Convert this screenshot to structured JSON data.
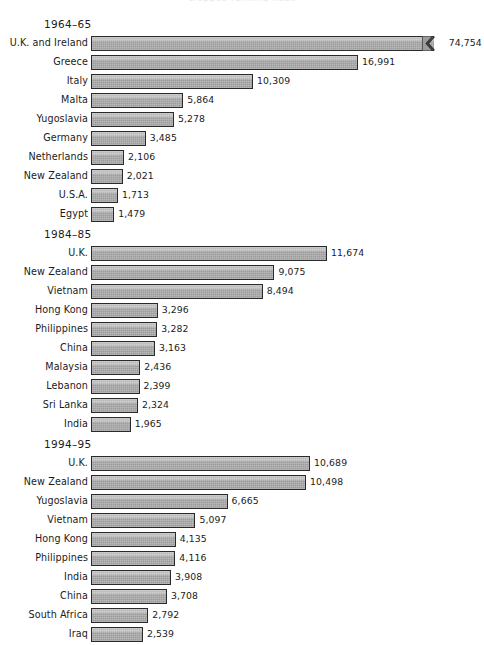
{
  "figure": {
    "cut_off_header": "cropped running head",
    "bar_color": "#9c9c9c",
    "bar_border_color": "#2a2a2a",
    "background": "#ffffff",
    "text_color": "#1b1b1b"
  },
  "chart_data": [
    {
      "type": "bar",
      "orientation": "horizontal",
      "title": "1964–65",
      "xlabel": "",
      "ylabel": "",
      "grid": false,
      "legend": null,
      "px_per_unit": 0.01572,
      "bar_origin_px": 91,
      "categories": [
        "U.K. and Ireland",
        "Greece",
        "Italy",
        "Malta",
        "Yugoslavia",
        "Germany",
        "Netherlands",
        "New Zealand",
        "U.S.A.",
        "Egypt"
      ],
      "values": [
        74754,
        16991,
        10309,
        5864,
        5278,
        3485,
        2106,
        2021,
        1713,
        1479
      ],
      "value_labels": [
        "74,754",
        "16,991",
        "10,309",
        "5,864",
        "5,278",
        "3,485",
        "2,106",
        "2,021",
        "1,713",
        "1,479"
      ],
      "truncated_bars": [
        true,
        false,
        false,
        false,
        false,
        false,
        false,
        false,
        false,
        false
      ],
      "truncated_draw_value": 21800,
      "axis_break_symbol": "zigzag"
    },
    {
      "type": "bar",
      "orientation": "horizontal",
      "title": "1984–85",
      "xlabel": "",
      "ylabel": "",
      "grid": false,
      "legend": null,
      "px_per_unit": 0.02022,
      "bar_origin_px": 91,
      "categories": [
        "U.K.",
        "New Zealand",
        "Vietnam",
        "Hong Kong",
        "Philippines",
        "China",
        "Malaysia",
        "Lebanon",
        "Sri Lanka",
        "India"
      ],
      "values": [
        11674,
        9075,
        8494,
        3296,
        3282,
        3163,
        2436,
        2399,
        2324,
        1965
      ],
      "value_labels": [
        "11,674",
        "9,075",
        "8,494",
        "3,296",
        "3,282",
        "3,163",
        "2,436",
        "2,399",
        "2,324",
        "1,965"
      ],
      "truncated_bars": [
        false,
        false,
        false,
        false,
        false,
        false,
        false,
        false,
        false,
        false
      ]
    },
    {
      "type": "bar",
      "orientation": "horizontal",
      "title": "1994–95",
      "xlabel": "",
      "ylabel": "",
      "grid": false,
      "legend": null,
      "px_per_unit": 0.02049,
      "bar_origin_px": 91,
      "categories": [
        "U.K.",
        "New Zealand",
        "Yugoslavia",
        "Vietnam",
        "Hong Kong",
        "Philippines",
        "India",
        "China",
        "South Africa",
        "Iraq"
      ],
      "values": [
        10689,
        10498,
        6665,
        5097,
        4135,
        4116,
        3908,
        3708,
        2792,
        2539
      ],
      "value_labels": [
        "10,689",
        "10,498",
        "6,665",
        "5,097",
        "4,135",
        "4,116",
        "3,908",
        "3,708",
        "2,792",
        "2,539"
      ],
      "truncated_bars": [
        false,
        false,
        false,
        false,
        false,
        false,
        false,
        false,
        false,
        false
      ]
    }
  ],
  "panel_tops_px": [
    18,
    228,
    438
  ]
}
